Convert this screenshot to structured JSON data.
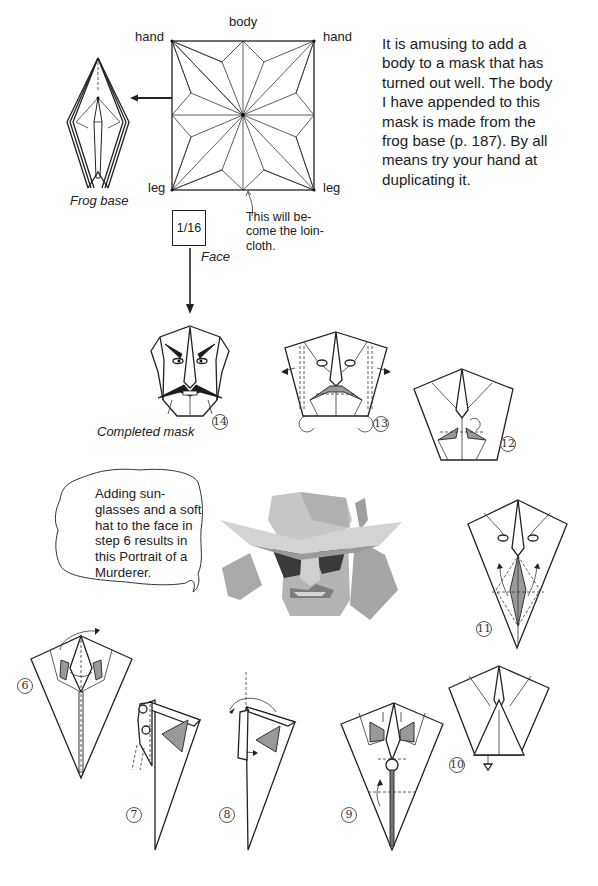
{
  "crease_pattern": {
    "labels": {
      "top": "body",
      "top_left": "hand",
      "top_right": "hand",
      "bottom_left": "leg",
      "bottom_right": "leg"
    },
    "note_lines": [
      "This will be-",
      "come the loin-",
      "cloth."
    ]
  },
  "frog_base": {
    "caption": "Frog base"
  },
  "face_piece": {
    "ratio": "1/16",
    "caption": "Face"
  },
  "intro_paragraph": {
    "lines": [
      "It is amusing to add a",
      "body to a mask that has",
      "turned out well. The body",
      "I have appended to this",
      "mask is made from the",
      "frog base (p. 187). By all",
      "means try your hand at",
      "duplicating it."
    ]
  },
  "completed_mask": {
    "caption": "Completed mask",
    "step": "14"
  },
  "steps": {
    "s6": "6",
    "s7": "7",
    "s8": "8",
    "s9": "9",
    "s10": "10",
    "s11": "11",
    "s12": "12",
    "s13": "13",
    "s14": "14"
  },
  "speech_bubble": {
    "lines": [
      "Adding sun-",
      "glasses and a soft",
      "hat to the face in",
      "step 6 results in",
      "this Portrait of a",
      "Murderer."
    ]
  },
  "photo": {
    "subject": "origami-murderer-portrait"
  },
  "colors": {
    "ink": "#222222",
    "shade": "#999999",
    "paper": "#ffffff",
    "photo_grey": "#b8b8b8"
  }
}
